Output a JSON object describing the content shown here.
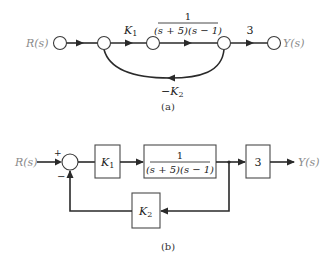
{
  "diagram_a": {
    "caption": "(a)",
    "type": "signal-flow-graph",
    "input_label": "R(s)",
    "output_label": "Y(s)",
    "branch_k1": {
      "base": "K",
      "sub": "1"
    },
    "branch_g": {
      "numerator": "1",
      "denominator": "(s + 5)(s − 1)"
    },
    "branch_3": "3",
    "feedback": {
      "prefix": "−",
      "base": "K",
      "sub": "2"
    }
  },
  "diagram_b": {
    "caption": "(b)",
    "type": "block-diagram",
    "input_label": "R(s)",
    "output_label": "Y(s)",
    "sum_plus": "+",
    "sum_minus": "−",
    "block_k1": {
      "base": "K",
      "sub": "1"
    },
    "block_g": {
      "numerator": "1",
      "denominator": "(s + 5)(s − 1)"
    },
    "block_3": "3",
    "block_k2": {
      "base": "K",
      "sub": "2"
    }
  },
  "colors": {
    "line": "#2a2a2a",
    "label_grey": "#8a8a8a",
    "background": "#ffffff"
  }
}
